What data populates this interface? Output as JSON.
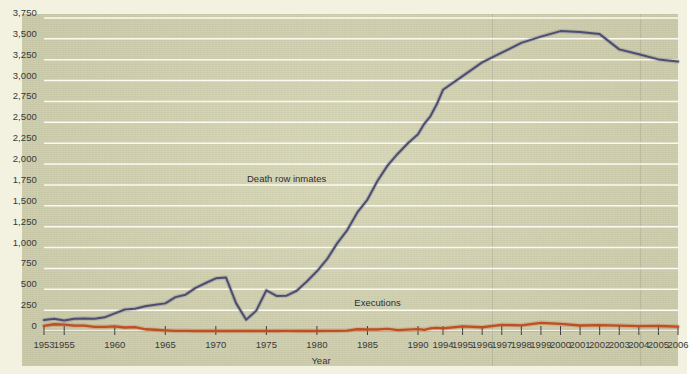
{
  "colors": {
    "background": "#f3f1e0",
    "plot_background": "#d6d6b4",
    "gridline": "#fbfaf0",
    "inmates_line": "#4d4d74",
    "executions_line": "#bf4f22",
    "axis_text": "#38383a"
  },
  "labels": {
    "xaxis_title": "Year",
    "series_inmates": "Death row inmates",
    "series_executions": "Executions"
  },
  "chart_data": {
    "type": "line",
    "title": "",
    "subtitle": "",
    "xlabel": "Year",
    "ylabel": "",
    "grid": true,
    "legend": "inline-annotations",
    "xlim": [
      1953,
      2006
    ],
    "ylim": [
      0,
      3750
    ],
    "ytick_labels": [
      "3,750",
      "3,500",
      "3,250",
      "3,000",
      "2,750",
      "2,500",
      "2,250",
      "2,000",
      "1,750",
      "1,500",
      "1,250",
      "1,000",
      "750",
      "500",
      "250",
      "0"
    ],
    "yticks": [
      3750,
      3500,
      3250,
      3000,
      2750,
      2500,
      2250,
      2000,
      1750,
      1500,
      1250,
      1000,
      750,
      500,
      250,
      0
    ],
    "xtick_labels": [
      "1953",
      "1955",
      "1960",
      "1965",
      "1970",
      "1975",
      "1980",
      "1985",
      "1990",
      "1994",
      "1995",
      "1996",
      "1997",
      "1998",
      "1999",
      "2000",
      "2001",
      "2002",
      "2003",
      "2004",
      "2005",
      "2006"
    ],
    "xticks": [
      1953,
      1955,
      1960,
      1965,
      1970,
      1975,
      1980,
      1985,
      1990,
      1994,
      1995,
      1996,
      1997,
      1998,
      1999,
      2000,
      2001,
      2002,
      2003,
      2004,
      2005,
      2006
    ],
    "x": [
      1953,
      1954,
      1955,
      1956,
      1957,
      1958,
      1959,
      1960,
      1961,
      1962,
      1963,
      1964,
      1965,
      1966,
      1967,
      1968,
      1969,
      1970,
      1971,
      1972,
      1973,
      1974,
      1975,
      1976,
      1977,
      1978,
      1979,
      1980,
      1981,
      1982,
      1983,
      1984,
      1985,
      1986,
      1987,
      1988,
      1989,
      1990,
      1991,
      1992,
      1993,
      1994,
      1995,
      1996,
      1997,
      1998,
      1999,
      2000,
      2001,
      2002,
      2003,
      2004,
      2005,
      2006
    ],
    "series": [
      {
        "name": "Death row inmates",
        "color": "#4d4d74",
        "values": [
          131,
          147,
          125,
          146,
          151,
          147,
          164,
          212,
          257,
          267,
          297,
          315,
          331,
          406,
          435,
          517,
          575,
          631,
          642,
          334,
          134,
          244,
          488,
          420,
          423,
          482,
          593,
          715,
          860,
          1050,
          1209,
          1420,
          1575,
          1800,
          1984,
          2124,
          2250,
          2356,
          2482,
          2575,
          2716,
          2890,
          3054,
          3219,
          3335,
          3452,
          3527,
          3593,
          3581,
          3557,
          3374,
          3315,
          3254,
          3228
        ]
      },
      {
        "name": "Executions",
        "color": "#bf4f22",
        "values": [
          62,
          81,
          76,
          65,
          65,
          49,
          49,
          56,
          42,
          47,
          21,
          15,
          7,
          1,
          2,
          0,
          0,
          0,
          0,
          0,
          0,
          0,
          0,
          0,
          1,
          0,
          2,
          0,
          1,
          2,
          5,
          21,
          18,
          18,
          25,
          11,
          16,
          23,
          14,
          31,
          38,
          31,
          56,
          45,
          74,
          68,
          98,
          85,
          66,
          71,
          65,
          59,
          60,
          53
        ]
      }
    ],
    "annotations": [
      {
        "text": "Death row inmates",
        "x": 1977,
        "y": 1820
      },
      {
        "text": "Executions",
        "x": 1986,
        "y": 330
      }
    ]
  }
}
